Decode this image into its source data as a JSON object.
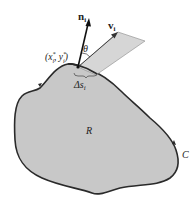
{
  "diagram": {
    "type": "flux-across-boundary",
    "labels": {
      "normal": "n",
      "normal_sub": "i",
      "velocity": "v",
      "velocity_sub": "i",
      "angle": "θ",
      "point_open": "(x",
      "point_x_sup": "*",
      "point_x_sub": "i",
      "point_comma": ", y",
      "point_y_sup": "*",
      "point_y_sub": "i",
      "point_close": ")",
      "delta": "Δs",
      "delta_sub": "i",
      "region": "R",
      "curve": "C"
    },
    "colors": {
      "region_fill": "#c8c8c8",
      "strip_fill": "#d6d6d6",
      "outline": "#2a2a2a",
      "background": "#ffffff"
    }
  }
}
